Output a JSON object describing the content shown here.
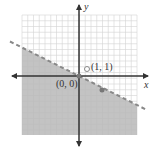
{
  "chart_data": {
    "type": "scatter",
    "title": "",
    "xlabel": "x",
    "ylabel": "y",
    "xlim": [
      -5.5,
      5.5
    ],
    "ylim": [
      -5.5,
      5.5
    ],
    "grid": true,
    "boundary_line": {
      "slope": -0.5,
      "intercept": 0,
      "style": "dashed"
    },
    "shaded_region": "below boundary line (y < -x/2)",
    "points": [
      {
        "label": "(0, 0)",
        "x": 0,
        "y": 0,
        "style": "filled"
      },
      {
        "label": "(1, 1)",
        "x": 1,
        "y": 1,
        "style": "open"
      },
      {
        "label": "",
        "x": 2,
        "y": -1,
        "style": "filled"
      }
    ]
  },
  "labels": {
    "x_axis": "x",
    "y_axis": "y",
    "origin": "(0, 0)",
    "test_point": "(1, 1)"
  },
  "colors": {
    "shade": "#b8b8b8",
    "grid": "#d4d4d4",
    "line": "#888888",
    "axis": "#333333"
  }
}
